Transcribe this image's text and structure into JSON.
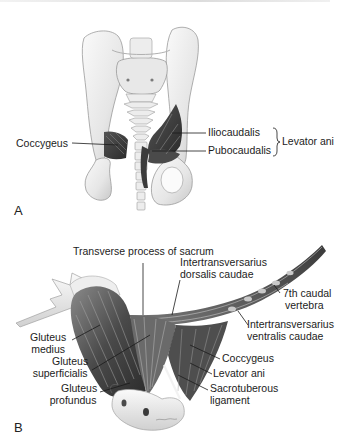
{
  "figure": {
    "panels": [
      {
        "id": "A",
        "letter": "A",
        "view": "pelvis, caudal/dorsal view",
        "labels": {
          "coccygeus": "Coccygeus",
          "iliocaudalis": "Iliocaudalis",
          "pubocaudalis": "Pubocaudalis",
          "levator_ani": "Levator ani"
        },
        "groups": [
          {
            "bracket": "}",
            "label": "Levator ani",
            "members": [
              "Iliocaudalis",
              "Pubocaudalis"
            ]
          }
        ]
      },
      {
        "id": "B",
        "letter": "B",
        "view": "lateral view of pelvis and tail",
        "labels": {
          "transverse_process": "Transverse process of sacrum",
          "itd_line1": "Intertransversarius",
          "itd_line2": "dorsalis caudae",
          "seventh_line1": "7th caudal",
          "seventh_line2": "vertebra",
          "itv_line1": "Intertransversarius",
          "itv_line2": "ventralis caudae",
          "gmed_line1": "Gluteus",
          "gmed_line2": "medius",
          "gsup_line1": "Gluteus",
          "gsup_line2": "superficialis",
          "gpro_line1": "Gluteus",
          "gpro_line2": "profundus",
          "coccygeus": "Coccygeus",
          "levator_ani": "Levator ani",
          "sacro_line1": "Sacrotuberous",
          "sacro_line2": "ligament"
        }
      }
    ],
    "colors": {
      "background": "#ffffff",
      "bone": "#ececec",
      "bone_shadow": "#b9b9b9",
      "muscle_dark": "#3a3a3a",
      "muscle_mid": "#6e6e6e",
      "leader_line": "#1a1a1a",
      "text": "#1c1c1c"
    }
  }
}
